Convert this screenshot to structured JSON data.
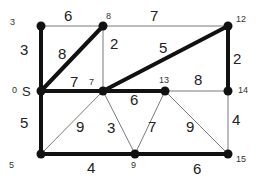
{
  "graph": {
    "nodes": [
      {
        "id": "S",
        "label": "0",
        "extra": "S"
      },
      {
        "id": "3",
        "label": "3"
      },
      {
        "id": "8",
        "label": "8"
      },
      {
        "id": "12",
        "label": "12"
      },
      {
        "id": "7",
        "label": "7"
      },
      {
        "id": "13",
        "label": "13"
      },
      {
        "id": "14",
        "label": "14"
      },
      {
        "id": "5",
        "label": "5"
      },
      {
        "id": "9",
        "label": "9"
      },
      {
        "id": "15",
        "label": "15"
      }
    ],
    "edges": [
      {
        "from": "S",
        "to": "3",
        "weight": "3",
        "bold": true
      },
      {
        "from": "3",
        "to": "8",
        "weight": "6",
        "bold": false
      },
      {
        "from": "8",
        "to": "12",
        "weight": "7",
        "bold": false
      },
      {
        "from": "S",
        "to": "8",
        "weight": "8",
        "bold": true
      },
      {
        "from": "8",
        "to": "7",
        "weight": "2",
        "bold": false
      },
      {
        "from": "7",
        "to": "12",
        "weight": "5",
        "bold": true
      },
      {
        "from": "12",
        "to": "14",
        "weight": "2",
        "bold": true
      },
      {
        "from": "S",
        "to": "7",
        "weight": "7",
        "bold": true
      },
      {
        "from": "7",
        "to": "13",
        "weight": "6",
        "bold": true
      },
      {
        "from": "13",
        "to": "14",
        "weight": "8",
        "bold": false
      },
      {
        "from": "S",
        "to": "5",
        "weight": "5",
        "bold": true
      },
      {
        "from": "5",
        "to": "7",
        "weight": "9",
        "bold": false
      },
      {
        "from": "7",
        "to": "9",
        "weight": "3",
        "bold": false
      },
      {
        "from": "13",
        "to": "9",
        "weight": "7",
        "bold": false
      },
      {
        "from": "13",
        "to": "15",
        "weight": "9",
        "bold": false
      },
      {
        "from": "14",
        "to": "15",
        "weight": "4",
        "bold": false
      },
      {
        "from": "5",
        "to": "9",
        "weight": "4",
        "bold": true
      },
      {
        "from": "9",
        "to": "15",
        "weight": "6",
        "bold": true
      }
    ]
  }
}
